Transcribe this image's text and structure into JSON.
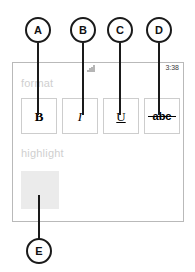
{
  "annotations": {
    "callouts": [
      {
        "letter": "A",
        "target": "bold-button"
      },
      {
        "letter": "B",
        "target": "italic-button"
      },
      {
        "letter": "C",
        "target": "underline-button"
      },
      {
        "letter": "D",
        "target": "strikethrough-button"
      },
      {
        "letter": "E",
        "target": "highlight-swatch"
      }
    ]
  },
  "phone": {
    "status_bar": {
      "signal_icon": "signal-bars-icon",
      "time": "3:38"
    },
    "sections": {
      "format": {
        "label": "format",
        "buttons": [
          {
            "name": "bold-button",
            "glyph": "B"
          },
          {
            "name": "italic-button",
            "glyph": "I"
          },
          {
            "name": "underline-button",
            "glyph": "U"
          },
          {
            "name": "strikethrough-button",
            "glyph": "abc"
          }
        ]
      },
      "highlight": {
        "label": "highlight",
        "swatch_color": "#ebebeb"
      }
    }
  },
  "colors": {
    "callout_stroke": "#1a1a1a",
    "panel_border": "#b9b9b9",
    "button_border": "#cdcdcd",
    "section_label": "#cfcfcf",
    "swatch": "#ebebeb",
    "background": "#ffffff"
  }
}
